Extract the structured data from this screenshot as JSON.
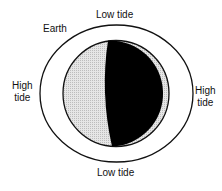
{
  "diagram": {
    "labels": {
      "earth": "Earth",
      "top": "Low tide",
      "bottom": "Low tide",
      "left_line1": "High",
      "left_line2": "tide",
      "right_line1": "High",
      "right_line2": "tide"
    },
    "colors": {
      "outline": "#111111",
      "lit_side": "#dcdcdc",
      "dark_side": "#000000"
    }
  }
}
